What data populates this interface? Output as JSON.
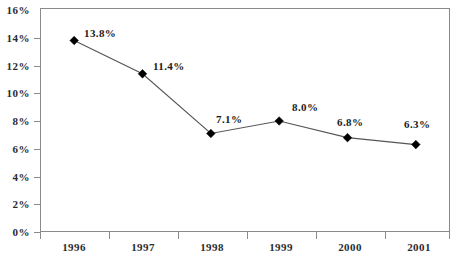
{
  "chart_data": {
    "type": "line",
    "title": "",
    "subtitle": "",
    "xlabel": "",
    "ylabel": "",
    "categories": [
      "1996",
      "1997",
      "1998",
      "1999",
      "2000",
      "2001"
    ],
    "values": [
      13.8,
      11.4,
      7.1,
      8.0,
      6.8,
      6.3
    ],
    "point_labels": [
      "13.8%",
      "11.4%",
      "7.1%",
      "8.0%",
      "6.8%",
      "6.3%"
    ],
    "series": [
      {
        "name": "",
        "values": [
          13.8,
          11.4,
          7.1,
          8.0,
          6.8,
          6.3
        ]
      }
    ],
    "ylim": [
      0,
      16
    ],
    "ytick_values": [
      0,
      2,
      4,
      6,
      8,
      10,
      12,
      14,
      16
    ],
    "ytick_labels": [
      "0%",
      "2%",
      "4%",
      "6%",
      "8%",
      "10%",
      "12%",
      "14%",
      "16%"
    ],
    "grid": false,
    "legend": false,
    "legend_position": "none",
    "marker": "diamond",
    "line_color": "#555555",
    "marker_color": "#000000",
    "axis_color": "#8a8a8a",
    "text_color": "#2b2b2b",
    "background_color": "#ffffff"
  },
  "axes": {
    "y_labels": [
      {
        "text": "16%",
        "value": 16
      },
      {
        "text": "14%",
        "value": 14
      },
      {
        "text": "12%",
        "value": 12
      },
      {
        "text": "10%",
        "value": 10
      },
      {
        "text": "8%",
        "value": 8
      },
      {
        "text": "6%",
        "value": 6
      },
      {
        "text": "4%",
        "value": 4
      },
      {
        "text": "2%",
        "value": 2
      },
      {
        "text": "0%",
        "value": 0
      }
    ],
    "x_labels": [
      {
        "text": "1996"
      },
      {
        "text": "1997"
      },
      {
        "text": "1998"
      },
      {
        "text": "1999"
      },
      {
        "text": "2000"
      },
      {
        "text": "2001"
      }
    ]
  },
  "data_labels": [
    {
      "text": "13.8%",
      "category": "1996"
    },
    {
      "text": "11.4%",
      "category": "1997"
    },
    {
      "text": "7.1%",
      "category": "1998"
    },
    {
      "text": "8.0%",
      "category": "1999"
    },
    {
      "text": "6.8%",
      "category": "2000"
    },
    {
      "text": "6.3%",
      "category": "2001"
    }
  ]
}
